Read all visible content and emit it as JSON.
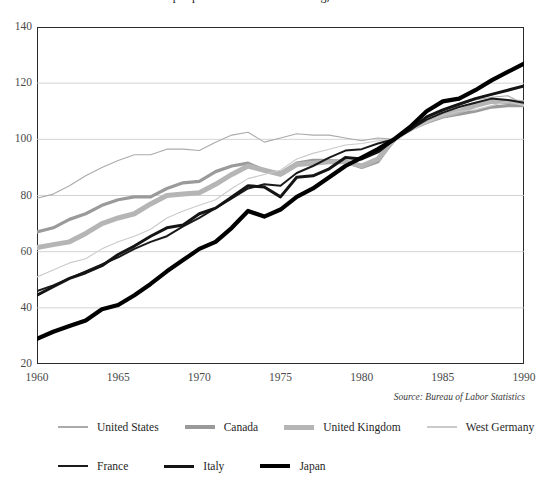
{
  "chart_data": {
    "type": "line",
    "title": "Output per Hour in Manufacturing, 1960-1990",
    "subtitle": "",
    "xlabel": "",
    "ylabel": "",
    "xlim": [
      1960,
      1990
    ],
    "ylim": [
      20,
      140
    ],
    "ytick_values": [
      140,
      120,
      100,
      80,
      60,
      40,
      20
    ],
    "xtick_values": [
      1960,
      1965,
      1970,
      1975,
      1980,
      1985,
      1990
    ],
    "grid": "horizontal",
    "legend_position": "below",
    "source_note": "Source: Bureau of Labor Statistics",
    "x": [
      1960,
      1961,
      1962,
      1963,
      1964,
      1965,
      1966,
      1967,
      1968,
      1969,
      1970,
      1971,
      1972,
      1973,
      1974,
      1975,
      1976,
      1977,
      1978,
      1979,
      1980,
      1981,
      1982,
      1983,
      1984,
      1985,
      1986,
      1987,
      1988,
      1989,
      1990
    ],
    "series": [
      {
        "name": "United States",
        "color": "#ababab",
        "width": 1.1,
        "values": [
          79.0,
          80.5,
          83.5,
          87.0,
          90.0,
          92.5,
          94.5,
          94.5,
          96.5,
          96.5,
          96.0,
          99.0,
          101.5,
          102.5,
          99.0,
          100.5,
          102.0,
          101.5,
          101.5,
          100.5,
          99.5,
          100.5,
          100.0,
          103.0,
          106.5,
          110.0,
          112.5,
          114.0,
          115.0,
          115.5,
          112.5
        ]
      },
      {
        "name": "Canada",
        "color": "#9a9a9a",
        "width": 3.2,
        "values": [
          67.0,
          68.5,
          71.5,
          73.5,
          76.5,
          78.5,
          79.5,
          79.5,
          82.5,
          84.5,
          85.0,
          88.5,
          90.5,
          91.5,
          89.0,
          88.0,
          91.5,
          92.5,
          92.5,
          92.0,
          90.0,
          92.0,
          100.0,
          103.5,
          106.0,
          108.0,
          109.0,
          110.0,
          111.5,
          112.0,
          112.0
        ]
      },
      {
        "name": "United Kingdom",
        "color": "#b5b5b5",
        "width": 5.0,
        "values": [
          61.5,
          62.5,
          63.5,
          66.5,
          70.0,
          72.0,
          73.5,
          77.0,
          80.0,
          80.5,
          81.0,
          84.0,
          87.5,
          90.5,
          89.0,
          87.5,
          91.0,
          91.5,
          92.0,
          92.0,
          90.5,
          93.0,
          100.0,
          104.0,
          106.5,
          108.5,
          110.0,
          112.0,
          113.5,
          113.5,
          113.0
        ]
      },
      {
        "name": "West Germany",
        "color": "#cacaca",
        "width": 1.1,
        "values": [
          51.0,
          53.5,
          56.0,
          57.5,
          61.0,
          63.5,
          65.5,
          68.0,
          72.0,
          74.5,
          76.5,
          78.5,
          82.5,
          86.0,
          87.5,
          89.0,
          93.0,
          95.0,
          96.5,
          98.0,
          98.5,
          99.5,
          100.0,
          103.0,
          106.0,
          108.5,
          110.0,
          110.5,
          112.0,
          113.5,
          112.0
        ]
      },
      {
        "name": "France",
        "color": "#1a1a1a",
        "width": 2.0,
        "values": [
          46.0,
          48.0,
          50.5,
          53.0,
          55.5,
          58.0,
          61.0,
          63.5,
          65.5,
          69.0,
          72.0,
          75.5,
          79.0,
          82.5,
          84.0,
          83.5,
          88.0,
          90.5,
          93.5,
          96.0,
          96.5,
          98.5,
          100.0,
          103.5,
          107.0,
          109.5,
          111.5,
          113.0,
          114.5,
          114.0,
          113.0
        ]
      },
      {
        "name": "Italy",
        "color": "#141414",
        "width": 3.0,
        "values": [
          44.5,
          47.5,
          50.5,
          52.5,
          55.0,
          59.0,
          62.0,
          65.5,
          68.5,
          69.5,
          73.5,
          75.5,
          79.5,
          83.5,
          83.0,
          79.5,
          86.5,
          87.0,
          89.5,
          93.5,
          93.0,
          95.5,
          100.0,
          103.5,
          108.0,
          110.5,
          112.5,
          114.5,
          116.0,
          117.5,
          119.0
        ]
      },
      {
        "name": "Japan",
        "color": "#000000",
        "width": 4.2,
        "values": [
          29.0,
          31.5,
          33.5,
          35.5,
          39.5,
          41.0,
          44.5,
          48.5,
          53.0,
          57.0,
          61.0,
          63.5,
          68.5,
          74.5,
          72.5,
          75.0,
          79.5,
          82.5,
          86.5,
          90.5,
          93.5,
          96.5,
          100.0,
          104.5,
          110.0,
          113.5,
          114.5,
          117.5,
          121.0,
          124.0,
          127.0
        ]
      }
    ]
  },
  "axis": {
    "y_labels": [
      "140",
      "120",
      "100",
      "80",
      "60",
      "40",
      "20"
    ],
    "x_labels": [
      "1960",
      "1965",
      "1970",
      "1975",
      "1980",
      "1985",
      "1990"
    ]
  },
  "source": {
    "text": "Source: Bureau of Labor Statistics"
  },
  "legend": {
    "row1": [
      {
        "label": "United States"
      },
      {
        "label": "Canada"
      },
      {
        "label": "United Kingdom"
      },
      {
        "label": "West Germany"
      }
    ],
    "row2": [
      {
        "label": "France"
      },
      {
        "label": "Italy"
      },
      {
        "label": "Japan"
      }
    ]
  },
  "title": {
    "text": "Output per Hour in Manufacturing, 1960-1990"
  }
}
